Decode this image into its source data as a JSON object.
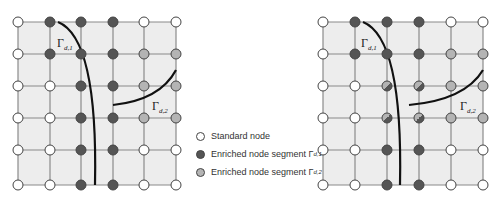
{
  "colors": {
    "standard": "#ffffff",
    "enriched_d1": "#555555",
    "enriched_d2": "#b4b4b4",
    "cell_fill": "#ededed",
    "grid_line": "#8a8a8a",
    "crack": "#111111"
  },
  "legend": {
    "items": [
      {
        "label": "Standard node",
        "type": "standard"
      },
      {
        "label": "Enriched node segment Γ",
        "sub": "d,1",
        "type": "d1"
      },
      {
        "label": "Enriched node segment Γ",
        "sub": "d,2",
        "type": "d2"
      }
    ]
  },
  "panels": [
    {
      "name": "left",
      "xs": [
        18,
        50,
        81,
        113,
        144,
        176
      ],
      "ys": [
        22,
        54,
        86,
        118,
        150,
        185
      ],
      "nodes": [
        [
          "W",
          "D",
          "D",
          "D",
          "W",
          "W"
        ],
        [
          "W",
          "D",
          "D",
          "D",
          "G",
          "G"
        ],
        [
          "W",
          "W",
          "D",
          "D",
          "G",
          "G"
        ],
        [
          "W",
          "W",
          "D",
          "D",
          "G",
          "G"
        ],
        [
          "W",
          "W",
          "D",
          "D",
          "W",
          "W"
        ],
        [
          "W",
          "W",
          "D",
          "D",
          "W",
          "W"
        ]
      ],
      "label1": {
        "text": "Γ",
        "sub": "d,1",
        "x": 57,
        "y": 47
      },
      "label2": {
        "text": "Γ",
        "sub": "d,2",
        "x": 152,
        "y": 110
      },
      "crack1": "M 58 22 Q 98 38 95 185",
      "crack2": "M 113 105 Q 160 100 176 70"
    },
    {
      "name": "right",
      "xs": [
        323,
        355,
        387,
        419,
        451,
        483
      ],
      "ys": [
        22,
        54,
        86,
        118,
        150,
        185
      ],
      "nodes": [
        [
          "W",
          "D",
          "D",
          "D",
          "W",
          "W"
        ],
        [
          "W",
          "D",
          "D",
          "D",
          "G",
          "G"
        ],
        [
          "W",
          "W",
          "M",
          "M",
          "G",
          "G"
        ],
        [
          "W",
          "W",
          "M",
          "M",
          "G",
          "G"
        ],
        [
          "W",
          "W",
          "D",
          "D",
          "W",
          "W"
        ],
        [
          "W",
          "W",
          "D",
          "D",
          "W",
          "W"
        ]
      ],
      "label1": {
        "text": "Γ",
        "sub": "d,1",
        "x": 361,
        "y": 47
      },
      "label2": {
        "text": "Γ",
        "sub": "d,2",
        "x": 460,
        "y": 110
      },
      "crack1": "M 363 22 Q 403 38 400 185",
      "crack2": "M 409 105 Q 465 100 483 70"
    }
  ]
}
